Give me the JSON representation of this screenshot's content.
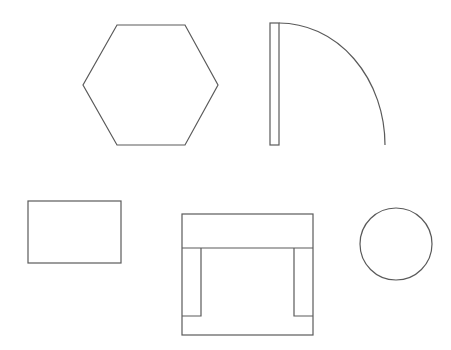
{
  "diagram": {
    "type": "floor-plan-symbols",
    "background": "#ffffff",
    "stroke_color": "#5a5a5a",
    "shapes": [
      {
        "id": "hexagon",
        "label": "hexagon",
        "points": [
          [
            117,
            25
          ],
          [
            185,
            25
          ],
          [
            218,
            85
          ],
          [
            185,
            145
          ],
          [
            117,
            145
          ],
          [
            83,
            85
          ]
        ]
      },
      {
        "id": "door",
        "label": "door-swing",
        "leaf": {
          "x": 270,
          "y": 23,
          "w": 9,
          "h": 122
        },
        "arc": {
          "from": [
            279,
            23
          ],
          "to": [
            385,
            145
          ],
          "r": 106
        }
      },
      {
        "id": "rectangle",
        "label": "table",
        "x": 28,
        "y": 201,
        "w": 93,
        "h": 62
      },
      {
        "id": "armchair",
        "label": "armchair",
        "x": 182,
        "y": 214,
        "w": 131,
        "h": 121,
        "back_y": 248,
        "arm_inner_left": 201,
        "arm_inner_right": 294,
        "arm_bottom": 316
      },
      {
        "id": "circle",
        "label": "circle",
        "cx": 396,
        "cy": 244,
        "r": 36
      }
    ]
  }
}
